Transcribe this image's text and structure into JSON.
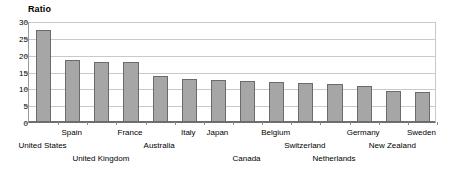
{
  "chart_data": {
    "type": "bar",
    "title": "Ratio",
    "xlabel": "",
    "ylabel": "",
    "ylim": [
      0,
      30
    ],
    "yticks": [
      0,
      5,
      10,
      15,
      20,
      25,
      30
    ],
    "grid": true,
    "legend": "none",
    "orientation": "vertical",
    "bar_color": "#a6a6a6",
    "bar_border_color": "#6b6b6b",
    "categories": [
      "United States",
      "Spain",
      "United Kingdom",
      "France",
      "Australia",
      "Italy",
      "Japan",
      "Canada",
      "Belgium",
      "Switzerland",
      "Netherlands",
      "Germany",
      "New Zealand",
      "Sweden"
    ],
    "values": [
      27.3,
      18.4,
      17.8,
      17.7,
      13.8,
      12.9,
      12.6,
      12.3,
      12.0,
      11.7,
      11.2,
      10.6,
      9.3,
      8.8
    ],
    "label_rows": [
      1,
      0,
      2,
      0,
      1,
      0,
      0,
      2,
      0,
      1,
      2,
      0,
      1,
      0
    ]
  }
}
